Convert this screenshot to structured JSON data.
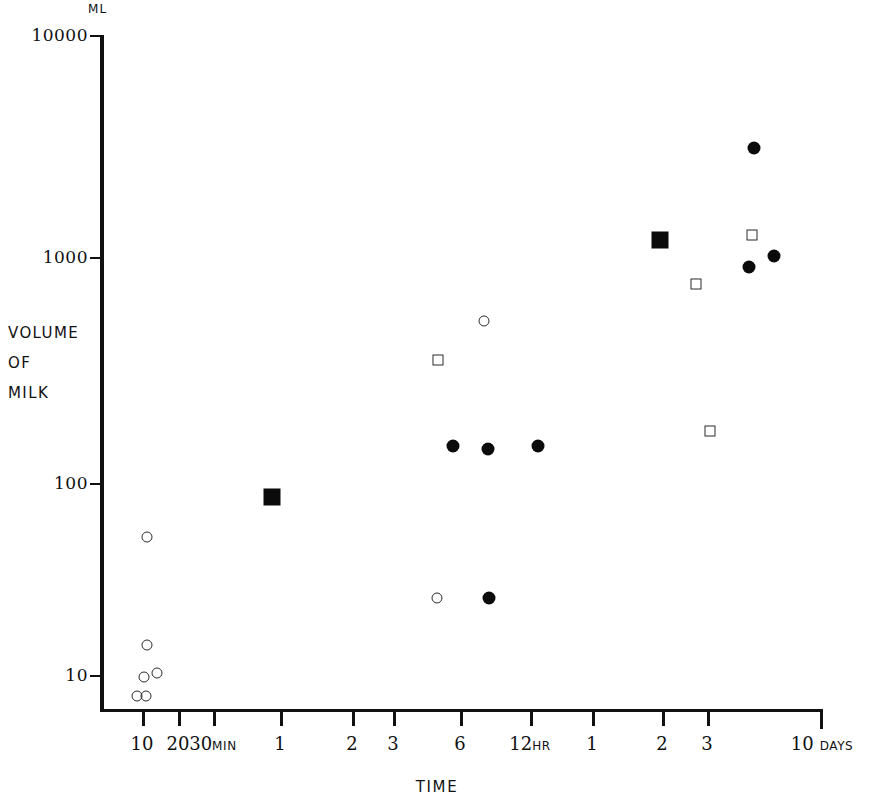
{
  "figure": {
    "unit_label": "ML",
    "y_axis_title_lines": [
      "VOLUME",
      "OF",
      "MILK"
    ],
    "x_axis_title": "TIME"
  },
  "chart_data": {
    "type": "scatter",
    "title": "",
    "xlabel": "TIME",
    "ylabel": "VOLUME OF MILK",
    "yunit": "ML",
    "y_scale": "log",
    "x_scale": "log-time",
    "grid": false,
    "legend": "none",
    "ylim": [
      7,
      10000
    ],
    "y_ticks": [
      {
        "label": "10000",
        "value": 10000
      },
      {
        "label": "1000",
        "value": 1000
      },
      {
        "label": "100",
        "value": 100
      },
      {
        "label": "10",
        "value": 10
      }
    ],
    "x_ticks": [
      {
        "label": "10",
        "unit": "",
        "minutes": 10
      },
      {
        "label": "20",
        "unit": "",
        "minutes": 20
      },
      {
        "label": "30",
        "unit": "MIN",
        "minutes": 30
      },
      {
        "label": "1",
        "unit": "",
        "minutes": 60
      },
      {
        "label": "2",
        "unit": "",
        "minutes": 120
      },
      {
        "label": "3",
        "unit": "",
        "minutes": 180
      },
      {
        "label": "6",
        "unit": "",
        "minutes": 360
      },
      {
        "label": "12",
        "unit": "HR",
        "minutes": 720
      },
      {
        "label": "1",
        "unit": "",
        "minutes": 1440
      },
      {
        "label": "2",
        "unit": "",
        "minutes": 2880
      },
      {
        "label": "3",
        "unit": "",
        "minutes": 4320
      },
      {
        "label": "10",
        "unit": "DAYS",
        "minutes": 14400
      }
    ],
    "series": [
      {
        "name": "open-circle",
        "marker": "circle-open",
        "points": [
          {
            "time": "10 min",
            "volume": 8
          },
          {
            "time": "10 min",
            "volume": 8
          },
          {
            "time": "11 min",
            "volume": 10
          },
          {
            "time": "12 min",
            "volume": 11
          },
          {
            "time": "12 min",
            "volume": 15
          },
          {
            "time": "11 min",
            "volume": 52
          },
          {
            "time": "5 hr",
            "volume": 26
          },
          {
            "time": "7 hr",
            "volume": 520
          }
        ]
      },
      {
        "name": "filled-circle",
        "marker": "circle-filled",
        "points": [
          {
            "time": "6 hr",
            "volume": 170
          },
          {
            "time": "7 hr",
            "volume": 160
          },
          {
            "time": "12 hr",
            "volume": 170
          },
          {
            "time": "7 hr",
            "volume": 25
          },
          {
            "time": "3.5 days",
            "volume": 3100
          },
          {
            "time": "3.3 days",
            "volume": 890
          },
          {
            "time": "4 days",
            "volume": 1010
          }
        ]
      },
      {
        "name": "open-square",
        "marker": "square-open",
        "points": [
          {
            "time": "5 hr",
            "volume": 400
          },
          {
            "time": "3 days",
            "volume": 190
          },
          {
            "time": "3 days",
            "volume": 720
          },
          {
            "time": "3.4 days",
            "volume": 1220
          }
        ]
      },
      {
        "name": "filled-square",
        "marker": "square-filled",
        "points": [
          {
            "time": "50 min",
            "volume": 88
          },
          {
            "time": "2 days",
            "volume": 1150
          }
        ]
      }
    ]
  },
  "layout": {
    "y_tick_pixels": {
      "10000": 35,
      "1000": 257,
      "100": 483,
      "10": 675
    },
    "x_tick_pixels": [
      142,
      178,
      213,
      280,
      352,
      393,
      460,
      530,
      592,
      662,
      707,
      822
    ],
    "marker_pixels": [
      {
        "marker": "circle-open",
        "x": 137,
        "y": 696
      },
      {
        "marker": "circle-open",
        "x": 146,
        "y": 696
      },
      {
        "marker": "circle-open",
        "x": 144,
        "y": 677
      },
      {
        "marker": "circle-open",
        "x": 157,
        "y": 673
      },
      {
        "marker": "circle-open",
        "x": 147,
        "y": 645
      },
      {
        "marker": "circle-open",
        "x": 147,
        "y": 537
      },
      {
        "marker": "square-filled",
        "x": 272,
        "y": 497
      },
      {
        "marker": "square-open",
        "x": 438,
        "y": 360
      },
      {
        "marker": "circle-open",
        "x": 484,
        "y": 321
      },
      {
        "marker": "circle-filled",
        "x": 453,
        "y": 446
      },
      {
        "marker": "circle-filled",
        "x": 488,
        "y": 449
      },
      {
        "marker": "circle-filled",
        "x": 538,
        "y": 446
      },
      {
        "marker": "circle-open",
        "x": 437,
        "y": 598
      },
      {
        "marker": "circle-filled",
        "x": 489,
        "y": 598
      },
      {
        "marker": "square-filled",
        "x": 660,
        "y": 240
      },
      {
        "marker": "square-open",
        "x": 696,
        "y": 284
      },
      {
        "marker": "square-open",
        "x": 710,
        "y": 431
      },
      {
        "marker": "square-open",
        "x": 752,
        "y": 235
      },
      {
        "marker": "circle-filled",
        "x": 754,
        "y": 148
      },
      {
        "marker": "circle-filled",
        "x": 749,
        "y": 267
      },
      {
        "marker": "circle-filled",
        "x": 774,
        "y": 256
      }
    ]
  }
}
